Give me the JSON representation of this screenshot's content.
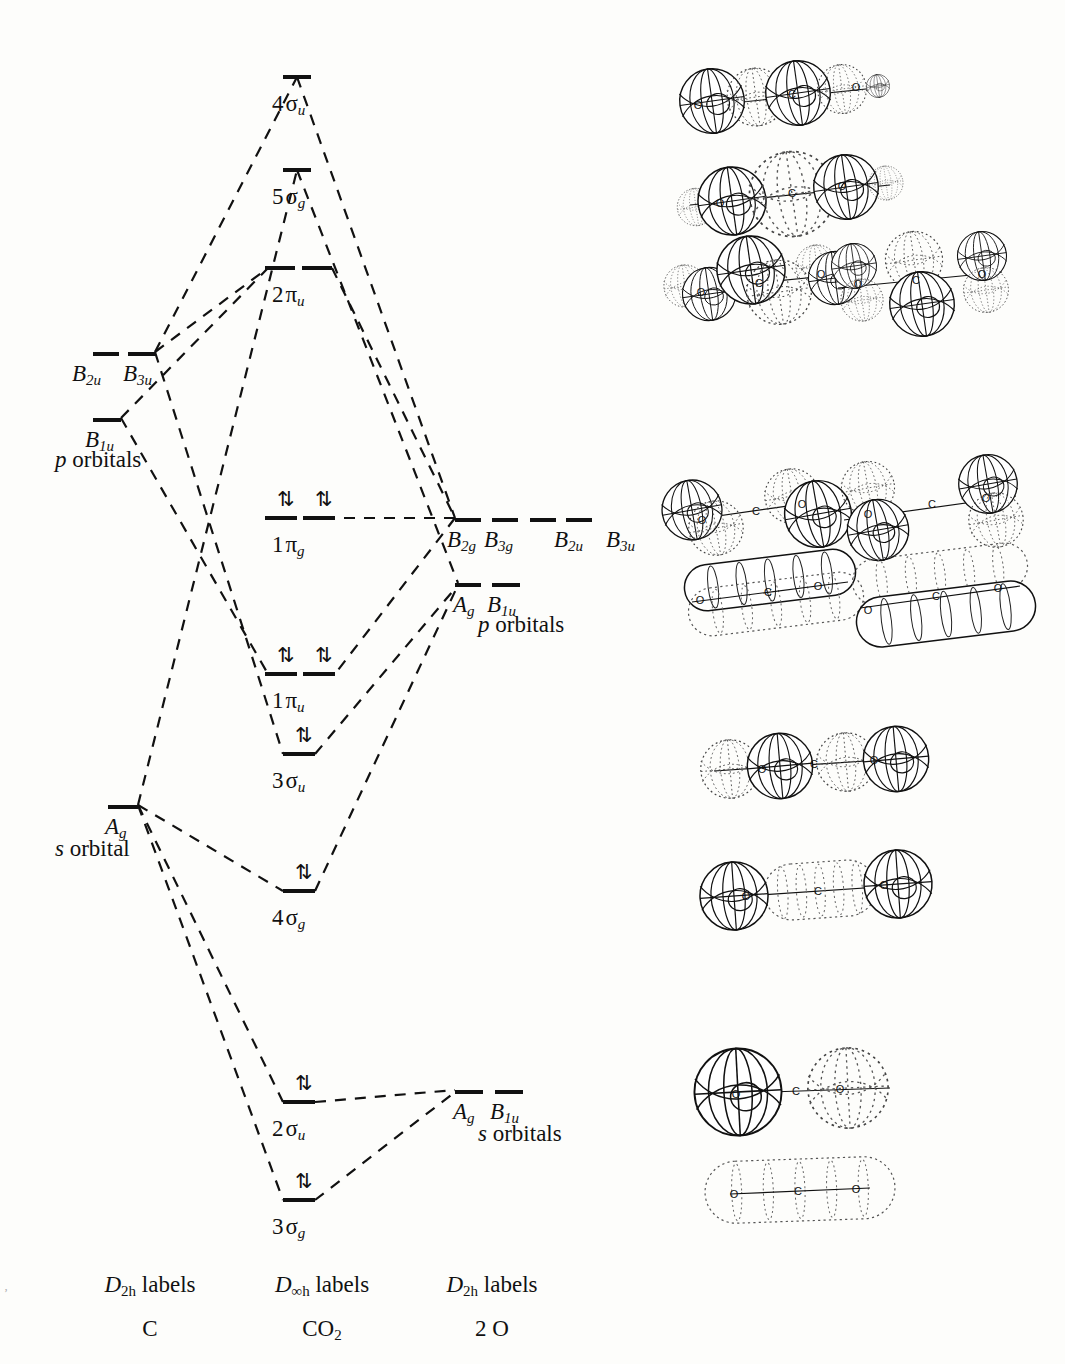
{
  "diagram": {
    "columns": [
      {
        "id": "left",
        "symmetry_labels": "D2h labels",
        "species": "C"
      },
      {
        "id": "center",
        "symmetry_labels": "D∞h labels",
        "species": "CO2"
      },
      {
        "id": "right",
        "symmetry_labels": "D2h labels",
        "species": "2 O"
      }
    ]
  },
  "axis_labels": [
    {
      "sym": "D",
      "sym_sub": "2h",
      "word": "labels",
      "species": "C",
      "x": 150,
      "y": 1272
    },
    {
      "sym": "D",
      "sym_sub": "∞h",
      "word": "labels",
      "species": "CO",
      "species_sub": "2",
      "x": 322,
      "y": 1272
    },
    {
      "sym": "D",
      "sym_sub": "2h",
      "word": "labels",
      "species": "2 O",
      "x": 492,
      "y": 1272
    }
  ],
  "left_atomic": {
    "group_p": {
      "caption": "p orbitals",
      "caption_x": 55,
      "caption_y": 447,
      "levels": [
        {
          "label": "B",
          "sub": "2u",
          "x": 93,
          "y": 352,
          "w": 26,
          "label_x": 72,
          "label_y": 362
        },
        {
          "label": "B",
          "sub": "3u",
          "x": 128,
          "y": 352,
          "w": 28,
          "label_x": 123,
          "label_y": 362
        }
      ],
      "lower": [
        {
          "label": "B",
          "sub": "1u",
          "x": 93,
          "y": 418,
          "w": 28,
          "label_x": 85,
          "label_y": 428
        }
      ]
    },
    "group_s": {
      "caption": "s orbital",
      "caption_x": 55,
      "caption_y": 836,
      "levels": [
        {
          "label": "A",
          "sub": "g",
          "x": 108,
          "y": 805,
          "w": 30,
          "label_x": 105,
          "label_y": 815
        }
      ]
    }
  },
  "right_atomic": {
    "group_p": {
      "caption": "p orbitals",
      "caption_x": 478,
      "caption_y": 612,
      "levels": [
        {
          "label": "B",
          "sub": "2g",
          "x": 455,
          "y": 518,
          "w": 26,
          "label_x": 447,
          "label_y": 528
        },
        {
          "label": "B",
          "sub": "3g",
          "x": 492,
          "y": 518,
          "w": 26,
          "label_x": 484,
          "label_y": 528
        },
        {
          "label": "B",
          "sub": "2u",
          "x": 530,
          "y": 518,
          "w": 26,
          "label_x": 554,
          "label_y": 528
        },
        {
          "label": "B",
          "sub": "3u",
          "x": 566,
          "y": 518,
          "w": 26,
          "label_x": 606,
          "label_y": 528
        }
      ],
      "lower": [
        {
          "label": "A",
          "sub": "g",
          "x": 455,
          "y": 583,
          "w": 26,
          "label_x": 453,
          "label_y": 593
        },
        {
          "label": "B",
          "sub": "1u",
          "x": 492,
          "y": 583,
          "w": 28,
          "label_x": 487,
          "label_y": 593
        }
      ]
    },
    "group_s": {
      "caption": "s orbitals",
      "caption_x": 478,
      "caption_y": 1121,
      "levels": [
        {
          "label": "A",
          "sub": "g",
          "x": 455,
          "y": 1090,
          "w": 28,
          "label_x": 453,
          "label_y": 1100
        },
        {
          "label": "B",
          "sub": "1u",
          "x": 495,
          "y": 1090,
          "w": 28,
          "label_x": 490,
          "label_y": 1100
        }
      ]
    }
  },
  "mo_levels": [
    {
      "id": "4su",
      "num": "4",
      "greek": "σ",
      "sub": "u",
      "y": 75,
      "bars": [
        {
          "x": 283,
          "w": 28
        }
      ],
      "electrons": [],
      "label_x": 272,
      "label_y": 92
    },
    {
      "id": "5sg",
      "num": "5",
      "greek": "σ",
      "sub": "g",
      "y": 168,
      "bars": [
        {
          "x": 283,
          "w": 28
        }
      ],
      "electrons": [],
      "label_x": 272,
      "label_y": 185
    },
    {
      "id": "2pu",
      "num": "2",
      "greek": "π",
      "sub": "u",
      "y": 266,
      "bars": [
        {
          "x": 265,
          "w": 30
        },
        {
          "x": 302,
          "w": 30
        }
      ],
      "electrons": [],
      "label_x": 272,
      "label_y": 283
    },
    {
      "id": "1pg",
      "num": "1",
      "greek": "π",
      "sub": "g",
      "y": 516,
      "bars": [
        {
          "x": 265,
          "w": 32
        },
        {
          "x": 303,
          "w": 32
        }
      ],
      "electrons": [
        {
          "x": 277,
          "y": 489,
          "pair": "⇅"
        },
        {
          "x": 315,
          "y": 489,
          "pair": "⇅"
        }
      ],
      "label_x": 272,
      "label_y": 533
    },
    {
      "id": "1pu",
      "num": "1",
      "greek": "π",
      "sub": "u",
      "y": 672,
      "bars": [
        {
          "x": 265,
          "w": 32
        },
        {
          "x": 303,
          "w": 32
        }
      ],
      "electrons": [
        {
          "x": 277,
          "y": 645,
          "pair": "⇅"
        },
        {
          "x": 315,
          "y": 645,
          "pair": "⇅"
        }
      ],
      "label_x": 272,
      "label_y": 689
    },
    {
      "id": "3su",
      "num": "3",
      "greek": "σ",
      "sub": "u",
      "y": 752,
      "bars": [
        {
          "x": 283,
          "w": 32
        }
      ],
      "electrons": [
        {
          "x": 295,
          "y": 725,
          "pair": "⇅"
        }
      ],
      "label_x": 272,
      "label_y": 769
    },
    {
      "id": "4sg",
      "num": "4",
      "greek": "σ",
      "sub": "g",
      "y": 889,
      "bars": [
        {
          "x": 283,
          "w": 32
        }
      ],
      "electrons": [
        {
          "x": 295,
          "y": 862,
          "pair": "⇅"
        }
      ],
      "label_x": 272,
      "label_y": 906
    },
    {
      "id": "2su",
      "num": "2",
      "greek": "σ",
      "sub": "u",
      "y": 1100,
      "bars": [
        {
          "x": 283,
          "w": 32
        }
      ],
      "electrons": [
        {
          "x": 295,
          "y": 1073,
          "pair": "⇅"
        }
      ],
      "label_x": 272,
      "label_y": 1117
    },
    {
      "id": "3sg",
      "num": "3",
      "greek": "σ",
      "sub": "g",
      "y": 1198,
      "bars": [
        {
          "x": 283,
          "w": 32
        }
      ],
      "electrons": [
        {
          "x": 295,
          "y": 1171,
          "pair": "⇅"
        }
      ],
      "label_x": 272,
      "label_y": 1215
    }
  ],
  "correlation_lines": [
    {
      "from": "C p (B3u)",
      "to": "4su",
      "d": "M155,352 L297,77"
    },
    {
      "from": "4su",
      "to": "O p",
      "d": "M297,77 L455,518"
    },
    {
      "from": "C s (Ag)",
      "to": "5sg",
      "d": "M138,805 L297,170"
    },
    {
      "from": "5sg",
      "to": "O p (Ag)",
      "d": "M297,170 L458,583"
    },
    {
      "from": "C p (B3u)",
      "to": "2pu",
      "d": "M155,352 L268,268"
    },
    {
      "from": "2pu",
      "to": "O p",
      "d": "M332,268 L455,518"
    },
    {
      "from": "C p (B1u)",
      "to": "2pu",
      "d": "M121,418 L268,268"
    },
    {
      "from": "O p",
      "to": "1pg-left",
      "d": "M455,518 L297,518"
    },
    {
      "from": "O p",
      "to": "1pu",
      "d": "M455,518 L335,674"
    },
    {
      "from": "C p",
      "to": "1pu",
      "d": "M121,418 L268,674"
    },
    {
      "from": "C p (B3u)",
      "to": "3su",
      "d": "M155,352 L283,754"
    },
    {
      "from": "3su",
      "to": "O p",
      "d": "M315,754 L458,585"
    },
    {
      "from": "C s (Ag)",
      "to": "4sg",
      "d": "M138,805 L283,891"
    },
    {
      "from": "4sg",
      "to": "O p (Ag)",
      "d": "M315,891 L458,585"
    },
    {
      "from": "C s (Ag)",
      "to": "2su",
      "d": "M138,805 L283,1102"
    },
    {
      "from": "2su",
      "to": "O s (Ag)",
      "d": "M315,1102 L455,1090"
    },
    {
      "from": "C s (Ag)",
      "to": "3sg",
      "d": "M138,805 L283,1200"
    },
    {
      "from": "3sg",
      "to": "O s (Ag)",
      "d": "M315,1200 L455,1092"
    }
  ],
  "orbital_pictures": [
    {
      "for": "4su",
      "kind": "sigma-antibonding-4lobe",
      "cx": 790,
      "cy": 95,
      "atoms": [
        "O",
        "C",
        "O"
      ],
      "note": "alternating solid/dotted lobes along axis"
    },
    {
      "for": "5sg",
      "kind": "sigma-5lobe",
      "cx": 790,
      "cy": 195,
      "atoms": [
        "O",
        "C",
        "O"
      ],
      "note": "solid end lobes, dotted central lobe"
    },
    {
      "for": "2pu",
      "kind": "pi-antibonding-a",
      "cx": 765,
      "cy": 282,
      "atoms": [
        "O",
        "C",
        "O"
      ],
      "note": "degenerate partner 1"
    },
    {
      "for": "2pu",
      "kind": "pi-antibonding-b",
      "cx": 920,
      "cy": 282,
      "atoms": [
        "O",
        "C",
        "O"
      ],
      "note": "degenerate partner 2"
    },
    {
      "for": "1pg",
      "kind": "pi-nonbonding-a",
      "cx": 760,
      "cy": 512,
      "atoms": [
        "O",
        "C",
        "O"
      ],
      "note": "oxygen-centred lobes, node at carbon"
    },
    {
      "for": "1pg",
      "kind": "pi-nonbonding-b",
      "cx": 930,
      "cy": 512,
      "atoms": [
        "O",
        "C",
        "O"
      ],
      "note": "perpendicular partner"
    },
    {
      "for": "1pu",
      "kind": "pi-bonding-a",
      "cx": 770,
      "cy": 590,
      "atoms": [
        "O",
        "C",
        "O"
      ],
      "note": "extended sausage lobes above/below axis"
    },
    {
      "for": "1pu",
      "kind": "pi-bonding-b",
      "cx": 940,
      "cy": 598,
      "atoms": [
        "O",
        "C",
        "O"
      ],
      "note": "perpendicular partner"
    },
    {
      "for": "3su",
      "kind": "sigma-u-4lobe",
      "cx": 820,
      "cy": 765,
      "atoms": [
        "O",
        "C",
        "O"
      ],
      "note": "two dotted, two solid spheres"
    },
    {
      "for": "4sg",
      "kind": "sigma-g-3lobe",
      "cx": 820,
      "cy": 890,
      "atoms": [
        "O",
        "C",
        "O"
      ],
      "note": "solid end spheres, dotted central ellipsoid"
    },
    {
      "for": "2su",
      "kind": "sigma-u-2lobe",
      "cx": 810,
      "cy": 1090,
      "atoms": [
        "O",
        "C",
        "O"
      ],
      "note": "one solid sphere, one dotted sphere"
    },
    {
      "for": "3sg",
      "kind": "sigma-g-envelope",
      "cx": 800,
      "cy": 1190,
      "atoms": [
        "O",
        "C",
        "O"
      ],
      "note": "single dotted peanut envelope"
    }
  ]
}
